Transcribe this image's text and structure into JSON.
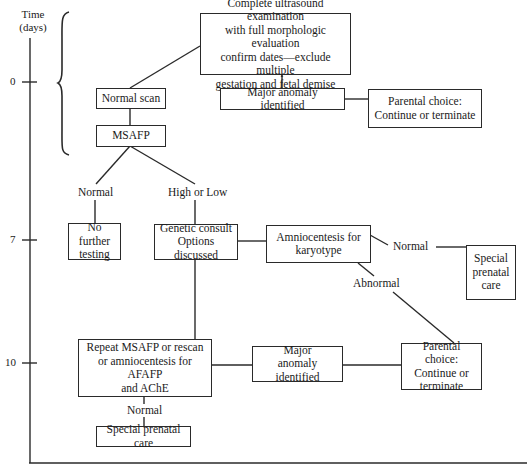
{
  "axis": {
    "title_line1": "Time",
    "title_line2": "(days)",
    "ticks": [
      {
        "label": "0",
        "y": 82
      },
      {
        "label": "7",
        "y": 240
      },
      {
        "label": "10",
        "y": 363
      }
    ]
  },
  "nodes": {
    "complete_us": "Complete ultrasound examination\nwith full morphologic evaluation\nconfirm dates—exclude multiple\ngestation and fetal demise",
    "normal_scan": "Normal scan",
    "msafp": "MSAFP",
    "major_anomaly_top": "Major anomaly identified",
    "parental_choice_top": "Parental choice:\nContinue or terminate",
    "no_further_testing": "No further\ntesting",
    "genetic_consult": "Genetic consult\nOptions discussed",
    "amniocentesis": "Amniocentesis for\nkaryotype",
    "special_care_right": "Special\nprenatal\ncare",
    "repeat_msafp": "Repeat MSAFP or rescan\nor amniocentesis for AFAFP\nand AChE",
    "major_anomaly_bottom": "Major\nanomaly identified",
    "parental_choice_bottom": "Parental choice:\nContinue or\nterminate",
    "special_care_bottom": "Special prenatal care"
  },
  "edge_labels": {
    "msafp_normal": "Normal",
    "msafp_high_low": "High or Low",
    "amnio_normal": "Normal",
    "amnio_abnormal": "Abnormal",
    "repeat_normal": "Normal"
  },
  "colors": {
    "line": "#2a2a2a",
    "background": "#ffffff"
  }
}
